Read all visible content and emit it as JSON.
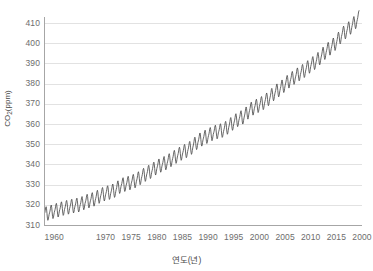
{
  "chart_data": {
    "type": "line",
    "title": "",
    "subtitle": "",
    "xlabel": "연도(년)",
    "ylabel": "CO2(ppm)",
    "ylabel_base": "CO",
    "ylabel_sub": "2",
    "ylabel_unit": "(ppm)",
    "xlim": [
      1958,
      2020
    ],
    "ylim": [
      310,
      413
    ],
    "grid": true,
    "grid_axis": "y",
    "legend": false,
    "legend_position": "none",
    "line_color": "#4d4d4d",
    "grid_color": "#e2e2e2",
    "axis_color": "#a6a6a6",
    "tick_label_color": "#6d6d6d",
    "background_color": "#ffffff",
    "y_ticks": [
      310,
      320,
      330,
      340,
      350,
      360,
      370,
      380,
      390,
      400,
      410
    ],
    "x_ticks": [
      {
        "value": 1960,
        "label": "1960"
      },
      {
        "value": 1970,
        "label": "1970"
      },
      {
        "value": 1975,
        "label": "1975"
      },
      {
        "value": 1980,
        "label": "1980"
      },
      {
        "value": 1985,
        "label": "1985"
      },
      {
        "value": 1990,
        "label": "1990"
      },
      {
        "value": 1995,
        "label": "1995"
      },
      {
        "value": 2000,
        "label": "2000"
      },
      {
        "value": 2005,
        "label": "2005"
      },
      {
        "value": 2010,
        "label": "2010"
      },
      {
        "value": 2015,
        "label": "2015"
      },
      {
        "value": 2020,
        "label": "2000"
      }
    ],
    "series": [
      {
        "name": "Mauna Loa monthly mean CO2",
        "seasonal_amplitude_ppm": 3.1,
        "seasonal_peak_month": 5,
        "x": [
          1958.0,
          1959.0,
          1960.0,
          1961.0,
          1962.0,
          1963.0,
          1964.0,
          1965.0,
          1966.0,
          1967.0,
          1968.0,
          1969.0,
          1970.0,
          1971.0,
          1972.0,
          1973.0,
          1974.0,
          1975.0,
          1976.0,
          1977.0,
          1978.0,
          1979.0,
          1980.0,
          1981.0,
          1982.0,
          1983.0,
          1984.0,
          1985.0,
          1986.0,
          1987.0,
          1988.0,
          1989.0,
          1990.0,
          1991.0,
          1992.0,
          1993.0,
          1994.0,
          1995.0,
          1996.0,
          1997.0,
          1998.0,
          1999.0,
          2000.0,
          2001.0,
          2002.0,
          2003.0,
          2004.0,
          2005.0,
          2006.0,
          2007.0,
          2008.0,
          2009.0,
          2010.0,
          2011.0,
          2012.0,
          2013.0,
          2014.0,
          2015.0,
          2016.0,
          2017.0,
          2018.0,
          2019.0
        ],
        "values": [
          315.3,
          315.98,
          316.91,
          317.64,
          318.45,
          318.99,
          319.62,
          320.04,
          321.38,
          322.16,
          323.04,
          324.62,
          325.68,
          326.32,
          327.45,
          329.68,
          330.25,
          331.15,
          332.15,
          333.9,
          335.5,
          336.85,
          338.69,
          339.93,
          341.13,
          342.78,
          344.42,
          345.9,
          347.15,
          348.93,
          351.48,
          352.91,
          354.19,
          355.59,
          356.37,
          357.04,
          358.89,
          360.88,
          362.64,
          363.76,
          366.63,
          368.31,
          369.48,
          371.02,
          373.1,
          375.64,
          377.38,
          379.67,
          381.84,
          383.55,
          385.34,
          386.95,
          389.21,
          390.89,
          393.45,
          396.12,
          398.1,
          400.52,
          404.09,
          406.21,
          408.52,
          411.43
        ]
      }
    ]
  },
  "axis_titles": {
    "x": "연도(년)"
  }
}
